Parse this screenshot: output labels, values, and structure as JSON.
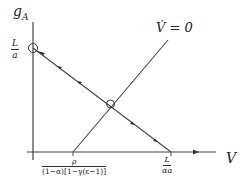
{
  "diagram": {
    "type": "phase-diagram",
    "y_axis_label": "g",
    "y_axis_label_sub": "A",
    "x_axis_label": "V",
    "y_intercept_label": {
      "num": "L",
      "den": "a"
    },
    "x_intercept_label": {
      "num": "L",
      "den": "αa"
    },
    "nullcline_label": "V̇ = 0",
    "nullcline_x_intercept": {
      "num": "ρ",
      "den": "(1−α)[1−γ(ε−1)]"
    },
    "colors": {
      "line": "#333333",
      "background": "#ffffff"
    },
    "points": [
      {
        "name": "y-intercept-equilibrium",
        "marker": "open-circle"
      },
      {
        "name": "saddle-equilibrium",
        "marker": "circle-cross"
      }
    ]
  }
}
